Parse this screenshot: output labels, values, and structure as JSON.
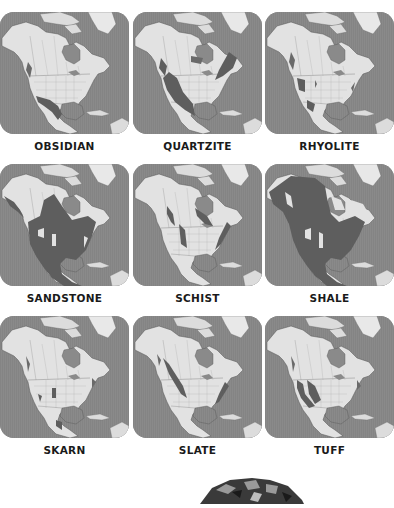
{
  "page": {
    "colors": {
      "ocean": "#8a8a8a",
      "land": "#e2e2e2",
      "highlight": "#5e5e5e",
      "greenland": "#e8e8e8",
      "label": "#1a1a1a"
    }
  },
  "maps": [
    {
      "label": "OBSIDIAN",
      "highlight": "obsidian"
    },
    {
      "label": "QUARTZITE",
      "highlight": "quartzite"
    },
    {
      "label": "RHYOLITE",
      "highlight": "rhyolite"
    },
    {
      "label": "SANDSTONE",
      "highlight": "sandstone"
    },
    {
      "label": "SCHIST",
      "highlight": "schist"
    },
    {
      "label": "SHALE",
      "highlight": "shale"
    },
    {
      "label": "SKARN",
      "highlight": "skarn"
    },
    {
      "label": "SLATE",
      "highlight": "slate"
    },
    {
      "label": "TUFF",
      "highlight": "tuff"
    }
  ],
  "bottom_image": {
    "subject": "rock-specimen-photo"
  }
}
